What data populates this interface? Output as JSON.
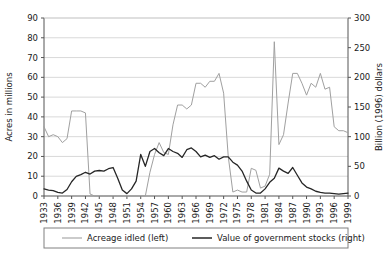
{
  "chart_data": {
    "type": "line",
    "title": "",
    "xlabel": "",
    "ylabel": "Acres in millions",
    "y2label": "Billion (1996) dollars",
    "ylim": [
      0,
      90
    ],
    "y2lim": [
      0,
      300
    ],
    "yticks": [
      0,
      10,
      20,
      30,
      40,
      50,
      60,
      70,
      80,
      90
    ],
    "y2ticks": [
      0,
      50,
      100,
      150,
      200,
      250,
      300
    ],
    "xlim": [
      1933,
      1999
    ],
    "xticks": [
      1933,
      1936,
      1939,
      1942,
      1945,
      1948,
      1951,
      1954,
      1957,
      1960,
      1963,
      1966,
      1969,
      1972,
      1975,
      1978,
      1981,
      1984,
      1987,
      1990,
      1993,
      1996,
      1999
    ],
    "grid": "horizontal",
    "legend_position": "bottom",
    "x": [
      1933,
      1934,
      1935,
      1936,
      1937,
      1938,
      1939,
      1940,
      1941,
      1942,
      1943,
      1944,
      1945,
      1946,
      1947,
      1948,
      1949,
      1950,
      1951,
      1952,
      1953,
      1954,
      1955,
      1956,
      1957,
      1958,
      1959,
      1960,
      1961,
      1962,
      1963,
      1964,
      1965,
      1966,
      1967,
      1968,
      1969,
      1970,
      1971,
      1972,
      1973,
      1974,
      1975,
      1976,
      1977,
      1978,
      1979,
      1980,
      1981,
      1982,
      1983,
      1984,
      1985,
      1986,
      1987,
      1988,
      1989,
      1990,
      1991,
      1992,
      1993,
      1994,
      1995,
      1996,
      1997,
      1998,
      1999
    ],
    "series": [
      {
        "name": "Acreage idled (left)",
        "axis": "left",
        "color": "#a0a0a0",
        "unit": "million acres",
        "values": [
          35,
          30,
          31,
          30,
          27,
          29,
          43,
          43,
          43,
          42,
          1,
          0,
          0,
          0,
          0,
          0,
          0,
          0,
          0,
          0,
          0,
          0,
          0,
          12,
          21,
          27,
          22,
          21,
          36,
          46,
          46,
          44,
          46,
          57,
          57,
          55,
          58,
          58,
          62,
          52,
          20,
          2,
          3,
          2,
          2,
          14,
          13,
          4,
          5,
          11,
          78,
          26,
          31,
          47,
          62,
          62,
          57,
          51,
          57,
          55,
          62,
          54,
          55,
          35,
          33,
          33,
          32
        ]
      },
      {
        "name": "Value of government stocks (right)",
        "axis": "right",
        "color": "#262626",
        "unit": "billion 1996 dollars",
        "values": [
          12,
          10,
          9,
          6,
          5,
          11,
          24,
          33,
          36,
          40,
          37,
          42,
          43,
          42,
          46,
          48,
          30,
          10,
          4,
          12,
          25,
          70,
          50,
          75,
          80,
          73,
          68,
          80,
          75,
          72,
          65,
          78,
          81,
          75,
          66,
          69,
          65,
          68,
          62,
          66,
          66,
          57,
          52,
          42,
          25,
          10,
          5,
          5,
          12,
          23,
          30,
          47,
          42,
          38,
          48,
          35,
          22,
          15,
          12,
          8,
          6,
          5,
          5,
          4,
          3,
          4,
          5
        ]
      }
    ]
  },
  "legend": {
    "entries": [
      {
        "label": "Acreage idled (left)",
        "color": "#a0a0a0"
      },
      {
        "label": "Value of government stocks (right)",
        "color": "#262626"
      }
    ]
  }
}
